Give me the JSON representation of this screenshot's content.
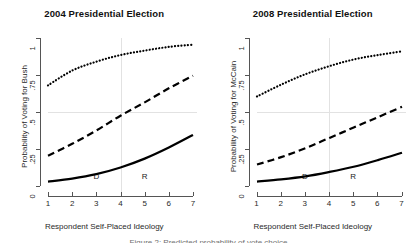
{
  "figure": {
    "width": 417,
    "height": 243,
    "background": "#ffffff",
    "axis_color": "#555555",
    "grid_color": "#e2e2e2",
    "curve_color": "#000000",
    "clipped_caption": "Figure 2: Predicted probability of vote choice"
  },
  "chart_data": [
    {
      "type": "line",
      "panel": "left",
      "title": "2004 Presidential Election",
      "xlabel": "Respondent Self-Placed Ideology",
      "ylabel": "Probability of Voting for Bush",
      "xlim": [
        1,
        7
      ],
      "ylim": [
        0,
        1
      ],
      "xticks": [
        1,
        2,
        3,
        4,
        5,
        6,
        7
      ],
      "xtick_labels": [
        "1",
        "2",
        "3",
        "4",
        "5",
        "6",
        "7"
      ],
      "yticks": [
        0,
        0.25,
        0.5,
        0.75,
        1
      ],
      "ytick_labels": [
        "0",
        ".25",
        ".5",
        ".75",
        "1"
      ],
      "grid": {
        "horizontal_at": [
          0.5
        ],
        "vertical_at": [
          4
        ]
      },
      "annotations": [
        {
          "text": "D",
          "x": 3,
          "y": 0.06
        },
        {
          "text": "R",
          "x": 5,
          "y": 0.06
        }
      ],
      "legend": "none",
      "x": [
        1,
        2,
        3,
        4,
        5,
        6,
        7
      ],
      "series": [
        {
          "name": "upper",
          "style": "dotted",
          "values": [
            0.68,
            0.78,
            0.84,
            0.885,
            0.915,
            0.94,
            0.955
          ]
        },
        {
          "name": "middle",
          "style": "dashed",
          "values": [
            0.205,
            0.285,
            0.375,
            0.475,
            0.565,
            0.66,
            0.745
          ]
        },
        {
          "name": "lower",
          "style": "solid",
          "values": [
            0.03,
            0.05,
            0.08,
            0.125,
            0.185,
            0.26,
            0.345
          ]
        }
      ]
    },
    {
      "type": "line",
      "panel": "right",
      "title": "2008 Presidential Election",
      "xlabel": "Respondent Self-Placed Ideology",
      "ylabel": "Probability of Voting for McCain",
      "xlim": [
        1,
        7
      ],
      "ylim": [
        0,
        1
      ],
      "xticks": [
        1,
        2,
        3,
        4,
        5,
        6,
        7
      ],
      "xtick_labels": [
        "1",
        "2",
        "3",
        "4",
        "5",
        "6",
        "7"
      ],
      "yticks": [
        0,
        0.25,
        0.5,
        0.75,
        1
      ],
      "ytick_labels": [
        "0",
        ".25",
        ".5",
        ".75",
        "1"
      ],
      "grid": {
        "horizontal_at": [
          0.5
        ],
        "vertical_at": [
          4
        ]
      },
      "annotations": [
        {
          "text": "D",
          "x": 3,
          "y": 0.06
        },
        {
          "text": "R",
          "x": 5,
          "y": 0.06
        }
      ],
      "legend": "none",
      "x": [
        1,
        2,
        3,
        4,
        5,
        6,
        7
      ],
      "series": [
        {
          "name": "upper",
          "style": "dotted",
          "values": [
            0.605,
            0.685,
            0.755,
            0.81,
            0.855,
            0.885,
            0.91
          ]
        },
        {
          "name": "middle",
          "style": "dashed",
          "values": [
            0.145,
            0.195,
            0.255,
            0.325,
            0.395,
            0.465,
            0.535
          ]
        },
        {
          "name": "lower",
          "style": "solid",
          "values": [
            0.03,
            0.045,
            0.065,
            0.095,
            0.13,
            0.175,
            0.225
          ]
        }
      ]
    }
  ]
}
